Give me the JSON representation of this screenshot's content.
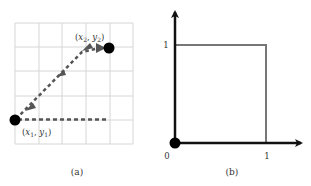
{
  "panel_a": {
    "caption": "(a)",
    "grid": {
      "columns": 5,
      "rows": 5,
      "line_color": "#d6d6d6"
    },
    "point1": {
      "label_x": "x",
      "label_x_sub": "1",
      "label_y": "y",
      "label_y_sub": "1",
      "label": "(x1, y1)"
    },
    "point2": {
      "label_x": "x",
      "label_x_sub": "2",
      "label_y": "y",
      "label_y_sub": "2",
      "label": "(x2, y2)"
    },
    "dashed_color": "#555555",
    "arrow_count": 4,
    "point_color": "#000000"
  },
  "panel_b": {
    "caption": "(b)",
    "origin_label": "0",
    "x_tick_label": "1",
    "y_tick_label": "1",
    "axis_color": "#111111",
    "square_color": "#777777"
  }
}
